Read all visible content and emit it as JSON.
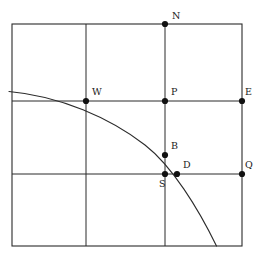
{
  "figure": {
    "title": "",
    "background_color": "#ffffff",
    "line_color": "#2b2b2b",
    "point_color": "#111111",
    "curve_color": "#2b2b2b",
    "frame": {
      "x": 12,
      "y": 24,
      "width": 230,
      "height": 222
    },
    "grid": {
      "vertical_lines_x": [
        86,
        165
      ],
      "horizontal_lines_y": [
        101,
        174
      ]
    },
    "points": [
      {
        "id": "N",
        "label": "N",
        "cx": 165,
        "cy": 24,
        "r": 3.1,
        "label_x": 172,
        "label_y": 19
      },
      {
        "id": "W",
        "label": "W",
        "cx": 86,
        "cy": 101,
        "r": 3.1,
        "label_x": 92,
        "label_y": 95
      },
      {
        "id": "P",
        "label": "P",
        "cx": 165,
        "cy": 101,
        "r": 3.1,
        "label_x": 171,
        "label_y": 95
      },
      {
        "id": "E",
        "label": "E",
        "cx": 242,
        "cy": 101,
        "r": 3.1,
        "label_x": 245,
        "label_y": 95
      },
      {
        "id": "B",
        "label": "B",
        "cx": 165,
        "cy": 155,
        "r": 3.1,
        "label_x": 171,
        "label_y": 149
      },
      {
        "id": "S",
        "label": "S",
        "cx": 165,
        "cy": 174,
        "r": 3.1,
        "label_x": 159,
        "label_y": 187
      },
      {
        "id": "D",
        "label": "D",
        "cx": 177,
        "cy": 174,
        "r": 3.1,
        "label_x": 183,
        "label_y": 168
      },
      {
        "id": "Q",
        "label": "Q",
        "cx": 242,
        "cy": 174,
        "r": 3.1,
        "label_x": 245,
        "label_y": 168
      }
    ],
    "curve": {
      "name": "arc",
      "description": "descending concave arc crossing the figure from the left edge to the bottom edge",
      "path": "M 9 91.5 C 60 96 110 118 145 145 C 172 166 198 208 216.5 246",
      "stroke_width": 1.1
    }
  }
}
